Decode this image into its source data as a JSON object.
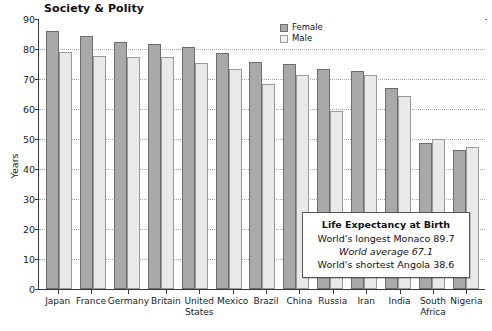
{
  "section_title": "Society & Polity",
  "legend": {
    "position": "top-right-inside",
    "items": [
      {
        "label": "Female",
        "color": "#a9a9a9"
      },
      {
        "label": "Male",
        "color": "#f2f2f2"
      }
    ]
  },
  "annotation": {
    "heading": "Life Expectancy at Birth",
    "line1": "World's longest Monaco 89.7",
    "line2": "World average 67.1",
    "line3": "World's shortest Angola 38.6"
  },
  "chart_data": {
    "type": "bar",
    "title": "Society & Polity",
    "xlabel": "",
    "ylabel": "Years",
    "ylim": [
      0,
      90
    ],
    "yticks": [
      0,
      10,
      20,
      30,
      40,
      50,
      60,
      70,
      80,
      90
    ],
    "grid": true,
    "legend_position": "top-right",
    "categories": [
      "Japan",
      "France",
      "Germany",
      "Britain",
      "United States",
      "Mexico",
      "Brazil",
      "China",
      "Russia",
      "Iran",
      "India",
      "South Africa",
      "Nigeria"
    ],
    "series": [
      {
        "name": "Female",
        "color": "#a9a9a9",
        "values": [
          86.0,
          84.3,
          82.5,
          81.6,
          80.6,
          78.8,
          75.6,
          75.0,
          73.2,
          72.8,
          67.0,
          48.6,
          46.2
        ]
      },
      {
        "name": "Male",
        "color": "#e9e9e9",
        "values": [
          79.0,
          77.6,
          77.5,
          77.4,
          75.5,
          73.2,
          68.2,
          71.2,
          59.2,
          71.4,
          64.5,
          50.0,
          47.4
        ]
      }
    ],
    "annotations": [
      "Life Expectancy at Birth",
      "World's longest Monaco 89.7",
      "World average 67.1",
      "World's shortest Angola 38.6"
    ]
  }
}
